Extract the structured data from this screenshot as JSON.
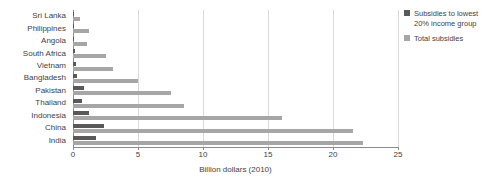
{
  "chart_data": {
    "type": "bar",
    "orientation": "horizontal",
    "title": "",
    "xlabel": "Billion dollars (2010)",
    "ylabel": "",
    "xlim": [
      0,
      25
    ],
    "xticks": [
      0,
      5,
      10,
      15,
      20,
      25
    ],
    "xtick_labels": [
      "0",
      "5",
      "10",
      "15",
      "20",
      "25"
    ],
    "grid": true,
    "legend_position": "right",
    "categories": [
      "Sri Lanka",
      "Philippines",
      "Angola",
      "South Africa",
      "Vietnam",
      "Bangladesh",
      "Pakistan",
      "Thailand",
      "Indonesia",
      "China",
      "India"
    ],
    "series": [
      {
        "name": "Subsidies to lowest 20% income group",
        "color": "#595959",
        "values": [
          0.05,
          0.08,
          0.1,
          0.12,
          0.2,
          0.3,
          0.85,
          0.7,
          1.25,
          2.4,
          1.75
        ]
      },
      {
        "name": "Total subsidies",
        "color": "#a6a6a6",
        "values": [
          0.5,
          1.2,
          1.1,
          2.5,
          3.1,
          5.0,
          7.5,
          8.5,
          16.1,
          21.5,
          22.3
        ]
      }
    ]
  },
  "legend": {
    "items": [
      {
        "label": "Subsidies to lowest 20% income group",
        "color": "#595959"
      },
      {
        "label": "Total subsidies",
        "color": "#a6a6a6"
      }
    ]
  }
}
